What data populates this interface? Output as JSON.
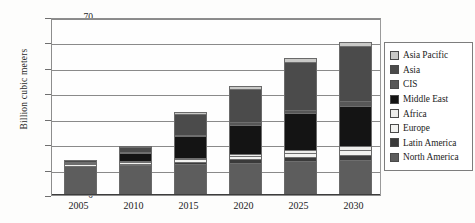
{
  "chart_data": {
    "type": "bar",
    "stacked": true,
    "title": "",
    "xlabel": "",
    "ylabel": "Billion cubic meters",
    "ylim": [
      0,
      70
    ],
    "ytick_step": 10,
    "yticks": [
      "70",
      "60",
      "50",
      "40",
      "30",
      "20",
      "10",
      "0"
    ],
    "grid": true,
    "legend_position": "right",
    "categories": [
      "2005",
      "2010",
      "2015",
      "2020",
      "2025",
      "2030"
    ],
    "series": [
      {
        "name": "North America",
        "swatch": "#5d5d5d",
        "values": [
          10.5,
          11.0,
          11.5,
          12.0,
          12.5,
          13.0
        ]
      },
      {
        "name": "Latin America",
        "swatch": "#3a3a3a",
        "values": [
          0.3,
          0.5,
          0.8,
          1.2,
          1.6,
          2.0
        ]
      },
      {
        "name": "Europe",
        "swatch": "#f2f2f0",
        "values": [
          0.6,
          0.8,
          1.0,
          1.3,
          1.6,
          2.0
        ]
      },
      {
        "name": "Africa",
        "swatch": "#ededeb",
        "values": [
          0.2,
          0.3,
          0.5,
          0.8,
          1.1,
          1.4
        ]
      },
      {
        "name": "Middle East",
        "swatch": "#141414",
        "values": [
          0.4,
          3.0,
          8.5,
          11.5,
          14.5,
          16.0
        ]
      },
      {
        "name": "CIS",
        "swatch": "#575757",
        "values": [
          0.2,
          0.4,
          0.7,
          1.0,
          1.3,
          1.6
        ]
      },
      {
        "name": "Asia",
        "swatch": "#4b4b4b",
        "values": [
          0.6,
          2.0,
          8.0,
          13.0,
          19.0,
          22.0
        ]
      },
      {
        "name": "Asia Pacific",
        "swatch": "#c9c9c7",
        "values": [
          0.2,
          0.5,
          1.0,
          1.2,
          1.4,
          1.5
        ]
      }
    ],
    "totals": [
      13.0,
      18.5,
      32.0,
      42.0,
      53.0,
      59.5
    ]
  },
  "legend": {
    "items": [
      {
        "label": "Asia Pacific"
      },
      {
        "label": "Asia"
      },
      {
        "label": "CIS"
      },
      {
        "label": "Middle East"
      },
      {
        "label": "Africa"
      },
      {
        "label": "Europe"
      },
      {
        "label": "Latin America"
      },
      {
        "label": "North America"
      }
    ]
  }
}
